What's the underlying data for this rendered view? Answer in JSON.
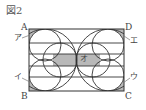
{
  "figure": {
    "title": "図2",
    "vertices": {
      "A": "A",
      "B": "B",
      "C": "C",
      "D": "D"
    },
    "regions": {
      "a": "ア",
      "i": "イ",
      "u": "ウ",
      "e": "エ",
      "o": "オ"
    },
    "colors": {
      "stroke": "#333333",
      "shade": "#b8b8b8",
      "background": "#ffffff"
    }
  }
}
